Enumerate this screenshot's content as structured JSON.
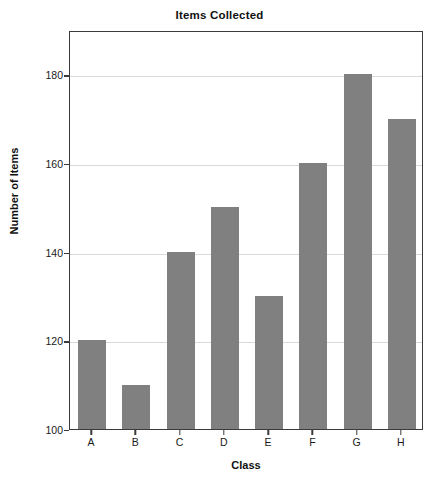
{
  "chart_data": {
    "type": "bar",
    "title": "Items Collected",
    "xlabel": "Class",
    "ylabel": "Number of Items",
    "categories": [
      "A",
      "B",
      "C",
      "D",
      "E",
      "F",
      "G",
      "H"
    ],
    "values": [
      120,
      110,
      140,
      150,
      130,
      160,
      180,
      170
    ],
    "ylim": [
      100,
      190
    ],
    "yticks": [
      100,
      120,
      140,
      160,
      180
    ],
    "ytick_labels": [
      "100",
      "120",
      "140",
      "160",
      "180"
    ],
    "grid": true,
    "grid_axis": "y",
    "legend": false,
    "series": [
      {
        "name": "Number of Items",
        "values": [
          120,
          110,
          140,
          150,
          130,
          160,
          180,
          170
        ]
      }
    ],
    "colors": {
      "bar_fill": "#808080",
      "gridline": "#d9d9d9",
      "frame": "#3b3b3b",
      "background": "#ffffff",
      "text": "#1a1a1a"
    }
  }
}
